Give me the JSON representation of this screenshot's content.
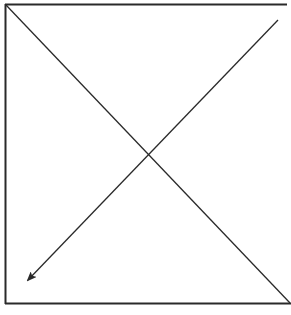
{
  "diagram": {
    "type": "line-drawing",
    "colors": {
      "background": "#ffffff",
      "stroke": "#2a2a2a"
    },
    "frame": {
      "left": 5,
      "top": 4,
      "right_top": 287,
      "right_bottom": 291,
      "bottom": 304
    },
    "lines": [
      {
        "name": "diagonal-top-left-to-bottom-right",
        "x1": 6,
        "y1": 5,
        "x2": 290,
        "y2": 303,
        "arrow": false
      },
      {
        "name": "diagonal-top-right-to-bottom-left",
        "x1": 278,
        "y1": 20,
        "x2": 28,
        "y2": 280,
        "arrow": true
      }
    ],
    "intersection": {
      "x": 150,
      "y": 153
    }
  }
}
